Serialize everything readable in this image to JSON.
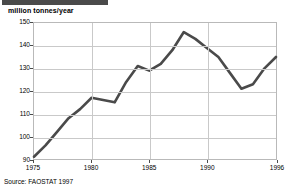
{
  "title_band": {
    "text": "",
    "color": "#4a4a4a"
  },
  "source": {
    "text": "Source: FAOSTAT 1997"
  },
  "chart_data": {
    "type": "line",
    "title": "",
    "xlabel": "",
    "ylabel": "million tonnes/year",
    "ylim": [
      90,
      150
    ],
    "xlim": [
      1975,
      1996
    ],
    "grid": true,
    "legend": "none",
    "line_color": "#4a4a4a",
    "y_ticks": [
      90,
      100,
      110,
      120,
      130,
      140,
      150
    ],
    "x_ticks": [
      1975,
      1980,
      1985,
      1990,
      1996
    ],
    "x": [
      1975,
      1976,
      1977,
      1978,
      1979,
      1980,
      1981,
      1982,
      1983,
      1984,
      1985,
      1986,
      1987,
      1988,
      1989,
      1990,
      1991,
      1992,
      1993,
      1994,
      1995,
      1996
    ],
    "values": [
      91,
      96,
      102,
      108,
      112,
      117,
      116,
      115,
      124,
      131,
      129,
      132,
      138,
      146,
      143,
      139,
      135,
      128,
      121,
      123,
      130,
      135
    ],
    "series": [
      {
        "name": "million tonnes/year",
        "values": [
          91,
          96,
          102,
          108,
          112,
          117,
          116,
          115,
          124,
          131,
          129,
          132,
          138,
          146,
          143,
          139,
          135,
          128,
          121,
          123,
          130,
          135
        ]
      }
    ],
    "annotations": {
      "peak_year": 1988,
      "peak_value": 146,
      "trough_year": 1993,
      "trough_value": 121,
      "start_value": 91,
      "end_value": 135
    }
  }
}
